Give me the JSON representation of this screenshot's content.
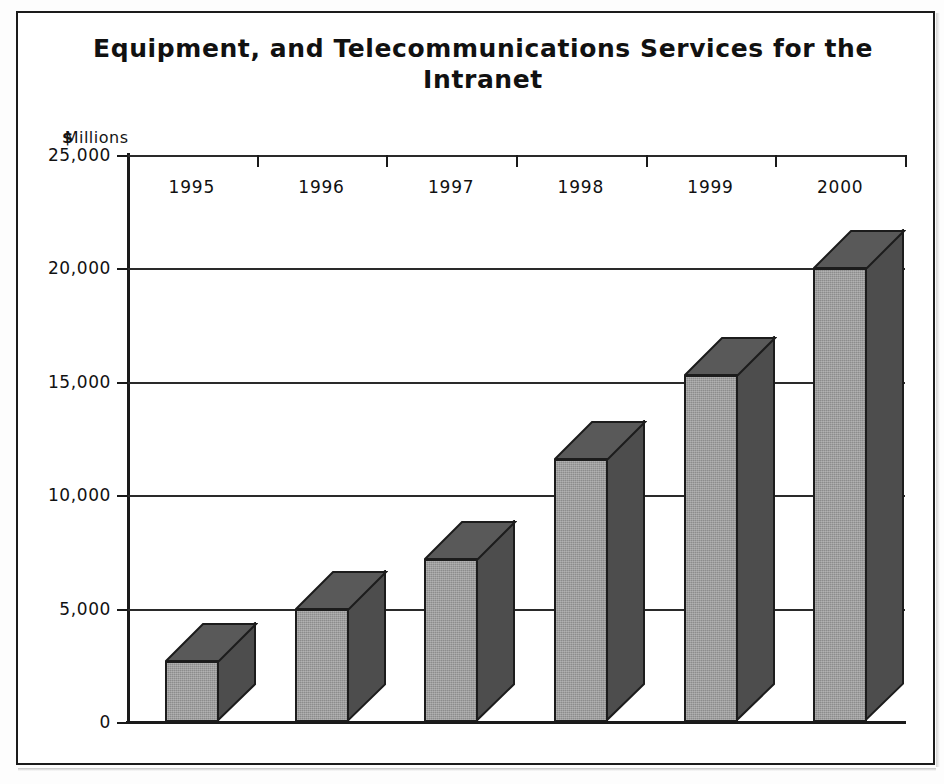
{
  "figure": {
    "title": "Equipment, and Telecommunications Services for the Intranet",
    "unit_dollar": "$",
    "unit_text": "Millions"
  },
  "chart_data": {
    "type": "bar",
    "title": "Equipment, and Telecommunications Services for the Intranet",
    "subtitle": "",
    "xlabel": "",
    "ylabel": "$Millions",
    "categories": [
      "1995",
      "1996",
      "1997",
      "1998",
      "1999",
      "2000"
    ],
    "values": [
      2700,
      5000,
      7200,
      11600,
      15300,
      20000
    ],
    "ylim": [
      0,
      25000
    ],
    "yticks": [
      0,
      5000,
      10000,
      15000,
      20000,
      25000
    ],
    "ytick_labels": [
      "0",
      "5,000",
      "10,000",
      "15,000",
      "20,000",
      "25,000"
    ],
    "grid": true,
    "grid_axis": "y",
    "legend": false,
    "style": "3d-bar",
    "series": [
      {
        "name": "Equipment and Telecommunications Services",
        "values": [
          2700,
          5000,
          7200,
          11600,
          15300,
          20000
        ]
      }
    ],
    "colors": {
      "bar_front": "#8c8c8c",
      "bar_side": "#4d4d4d",
      "bar_top": "#595959",
      "outline": "#1c1c1c",
      "gridline": "#2a2a2a",
      "text": "#111111"
    }
  }
}
